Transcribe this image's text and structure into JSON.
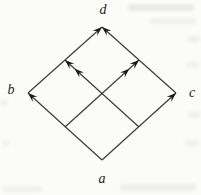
{
  "figure": {
    "background_color": "#fbfbf8",
    "line_color": "#3c3c3c",
    "arrow_color": "#1a1a1a",
    "label_color": "#1f1f1f",
    "label_font_size": 14,
    "vertices": [
      {
        "id": "a",
        "label": "a",
        "x": 102,
        "y": 160,
        "label_x": 102,
        "label_y": 178
      },
      {
        "id": "b",
        "label": "b",
        "x": 28,
        "y": 93,
        "label_x": 11,
        "label_y": 89
      },
      {
        "id": "c",
        "label": "c",
        "x": 176,
        "y": 93,
        "label_x": 192,
        "label_y": 92
      },
      {
        "id": "d",
        "label": "d",
        "x": 102,
        "y": 27,
        "label_x": 103,
        "label_y": 9
      }
    ],
    "edges": [
      {
        "name": "edge-a-b",
        "from": "a",
        "to": "b",
        "arrowheads": 1
      },
      {
        "name": "edge-a-c",
        "from": "a",
        "to": "c",
        "arrowheads": 1
      },
      {
        "name": "edge-b-d",
        "from": "b",
        "to": "d",
        "arrowheads": 1
      },
      {
        "name": "edge-c-d",
        "from": "c",
        "to": "d",
        "arrowheads": 1
      }
    ],
    "inner_arrows": [
      {
        "name": "inner-arrow-left-to-upper-right",
        "x1": 65,
        "y1": 127,
        "x2": 139,
        "y2": 60,
        "arrowheads": 2
      },
      {
        "name": "inner-arrow-right-to-upper-left",
        "x1": 139,
        "y1": 127,
        "x2": 65,
        "y2": 60,
        "arrowheads": 2
      }
    ],
    "arrowhead_length": 9.5,
    "arrowhead_halfwidth": 3.4,
    "double_head_gap": 13,
    "stroke_width": 1.2
  }
}
